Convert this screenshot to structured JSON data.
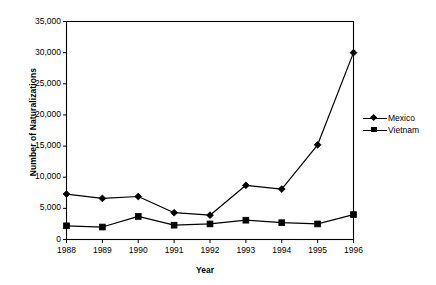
{
  "chart_data": {
    "type": "line",
    "title": "",
    "xlabel": "Year",
    "ylabel": "Number of Naturalizations",
    "categories": [
      "1988",
      "1989",
      "1990",
      "1991",
      "1992",
      "1993",
      "1994",
      "1995",
      "1996"
    ],
    "x": [
      1988,
      1989,
      1990,
      1991,
      1992,
      1993,
      1994,
      1995,
      1996
    ],
    "series": [
      {
        "name": "Mexico",
        "marker": "diamond",
        "color": "#000000",
        "values": [
          7300,
          6600,
          6900,
          4300,
          3900,
          8700,
          8100,
          15200,
          30000
        ]
      },
      {
        "name": "Vietnam",
        "marker": "square",
        "color": "#000000",
        "values": [
          2200,
          2000,
          3700,
          2300,
          2500,
          3100,
          2700,
          2500,
          4000
        ]
      }
    ],
    "ylim": [
      0,
      35000
    ],
    "yticks": [
      0,
      5000,
      10000,
      15000,
      20000,
      25000,
      30000,
      35000
    ],
    "ytick_labels": [
      "0",
      "5,000",
      "10,000",
      "15,000",
      "20,000",
      "25,000",
      "30,000",
      "35,000"
    ],
    "xtick_labels": [
      "1988",
      "1989",
      "1990",
      "1991",
      "1992",
      "1993",
      "1994",
      "1995",
      "1996"
    ],
    "grid": false,
    "legend_position": "right",
    "legend_entries": [
      "Mexico",
      "Vietnam"
    ],
    "frame": "box"
  },
  "axes": {
    "y_title": "Number of Naturalizations",
    "x_title": "Year"
  },
  "legend": {
    "items": [
      {
        "label": "Mexico",
        "marker": "diamond-marker-icon"
      },
      {
        "label": "Vietnam",
        "marker": "square-marker-icon"
      }
    ]
  }
}
